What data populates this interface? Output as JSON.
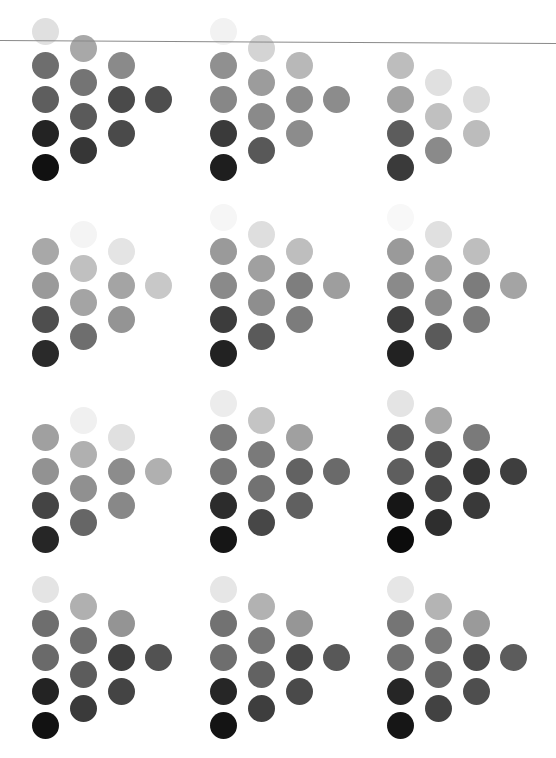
{
  "layout": {
    "group_origins_x": [
      45,
      223,
      400
    ],
    "group_origins_y": [
      31,
      217,
      403,
      589
    ],
    "col_dx": [
      0,
      38,
      76,
      113
    ],
    "col_dy": [
      0,
      17,
      34,
      68
    ],
    "row_step": 34,
    "dot_diameter": 27
  },
  "rule": {
    "color": "#8a8a8a",
    "y": 40
  },
  "groups": [
    {
      "row": 0,
      "col": 0,
      "columns": [
        [
          "#e0e0e0",
          "#6e6e6e",
          "#5e5e5e",
          "#232323",
          "#111111"
        ],
        [
          "#a8a8a8",
          "#747474",
          "#5a5a5a",
          "#363636"
        ],
        [
          "#8a8a8a",
          "#4a4a4a",
          "#4a4a4a"
        ],
        [
          "#4e4e4e"
        ]
      ]
    },
    {
      "row": 0,
      "col": 1,
      "columns": [
        [
          "#f2f2f2",
          "#909090",
          "#878787",
          "#3a3a3a",
          "#1e1e1e"
        ],
        [
          "#d4d4d4",
          "#9c9c9c",
          "#8a8a8a",
          "#585858"
        ],
        [
          "#b8b8b8",
          "#8c8c8c",
          "#8c8c8c"
        ],
        [
          "#8c8c8c"
        ]
      ]
    },
    {
      "row": 0,
      "col": 2,
      "columns": [
        [
          "#ffffff",
          "#bdbdbd",
          "#a2a2a2",
          "#5c5c5c",
          "#3a3a3a"
        ],
        [
          "#ffffff",
          "#e0e0e0",
          "#c0c0c0",
          "#8a8a8a"
        ],
        [
          "#ffffff",
          "#dcdcdc",
          "#bcbcbc"
        ],
        [
          "#ffffff"
        ]
      ]
    },
    {
      "row": 1,
      "col": 0,
      "columns": [
        [
          "#ffffff",
          "#a8a8a8",
          "#9a9a9a",
          "#4e4e4e",
          "#2a2a2a"
        ],
        [
          "#f4f4f4",
          "#c0c0c0",
          "#a4a4a4",
          "#6e6e6e"
        ],
        [
          "#e4e4e4",
          "#a4a4a4",
          "#949494"
        ],
        [
          "#c8c8c8"
        ]
      ]
    },
    {
      "row": 1,
      "col": 1,
      "columns": [
        [
          "#f6f6f6",
          "#9a9a9a",
          "#8a8a8a",
          "#3c3c3c",
          "#222222"
        ],
        [
          "#dedede",
          "#a0a0a0",
          "#8e8e8e",
          "#5a5a5a"
        ],
        [
          "#bebebe",
          "#7e7e7e",
          "#7c7c7c"
        ],
        [
          "#9e9e9e"
        ]
      ]
    },
    {
      "row": 1,
      "col": 2,
      "columns": [
        [
          "#f8f8f8",
          "#9a9a9a",
          "#8a8a8a",
          "#3e3e3e",
          "#222222"
        ],
        [
          "#e0e0e0",
          "#a2a2a2",
          "#8c8c8c",
          "#5a5a5a"
        ],
        [
          "#bebebe",
          "#7c7c7c",
          "#7a7a7a"
        ],
        [
          "#a4a4a4"
        ]
      ]
    },
    {
      "row": 2,
      "col": 0,
      "columns": [
        [
          "#ffffff",
          "#a0a0a0",
          "#929292",
          "#444444",
          "#262626"
        ],
        [
          "#f0f0f0",
          "#b0b0b0",
          "#909090",
          "#666666"
        ],
        [
          "#e0e0e0",
          "#8c8c8c",
          "#888888"
        ],
        [
          "#b0b0b0"
        ]
      ]
    },
    {
      "row": 2,
      "col": 1,
      "columns": [
        [
          "#ececec",
          "#7a7a7a",
          "#767676",
          "#2c2c2c",
          "#161616"
        ],
        [
          "#c4c4c4",
          "#7a7a7a",
          "#727272",
          "#474747"
        ],
        [
          "#a0a0a0",
          "#626262",
          "#606060"
        ],
        [
          "#6a6a6a"
        ]
      ]
    },
    {
      "row": 2,
      "col": 2,
      "columns": [
        [
          "#e4e4e4",
          "#5e5e5e",
          "#5e5e5e",
          "#161616",
          "#0c0c0c"
        ],
        [
          "#a8a8a8",
          "#505050",
          "#474747",
          "#2e2e2e"
        ],
        [
          "#7a7a7a",
          "#353535",
          "#393939"
        ],
        [
          "#3e3e3e"
        ]
      ]
    },
    {
      "row": 3,
      "col": 0,
      "columns": [
        [
          "#e4e4e4",
          "#6e6e6e",
          "#6a6a6a",
          "#232323",
          "#121212"
        ],
        [
          "#b0b0b0",
          "#6e6e6e",
          "#5c5c5c",
          "#3a3a3a"
        ],
        [
          "#949494",
          "#3e3e3e",
          "#444444"
        ],
        [
          "#525252"
        ]
      ]
    },
    {
      "row": 3,
      "col": 1,
      "columns": [
        [
          "#e6e6e6",
          "#727272",
          "#6e6e6e",
          "#262626",
          "#141414"
        ],
        [
          "#b2b2b2",
          "#767676",
          "#626262",
          "#3e3e3e"
        ],
        [
          "#969696",
          "#484848",
          "#4a4a4a"
        ],
        [
          "#585858"
        ]
      ]
    },
    {
      "row": 3,
      "col": 2,
      "columns": [
        [
          "#e6e6e6",
          "#757575",
          "#707070",
          "#262626",
          "#161616"
        ],
        [
          "#b4b4b4",
          "#7a7a7a",
          "#666666",
          "#424242"
        ],
        [
          "#9a9a9a",
          "#4c4c4c",
          "#4e4e4e"
        ],
        [
          "#5c5c5c"
        ]
      ]
    }
  ]
}
